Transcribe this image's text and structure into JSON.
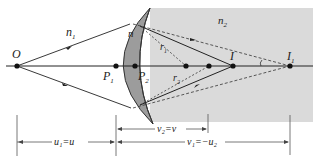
{
  "diagram": {
    "media": {
      "n1": "n",
      "n2": "n",
      "n": "n"
    },
    "labels": {
      "O": "O",
      "n1": "n",
      "n1_sub": "1",
      "n2": "n",
      "n2_sub": "2",
      "n_lens": "n",
      "P1": "P",
      "P1_sub": "1",
      "P2": "P",
      "P2_sub": "2",
      "I": "I",
      "I1": "I",
      "I1_sub": "1",
      "r1": "r",
      "r1_sub": "1",
      "r2": "r",
      "r2_sub": "2"
    },
    "dimensions": {
      "u1": "u₁=u",
      "v2": "v₂=v",
      "v1": "v₁=−u₂"
    },
    "colors": {
      "medium2": "#d9d9d9",
      "lens": "#9a9a9a",
      "line": "#222222"
    }
  }
}
